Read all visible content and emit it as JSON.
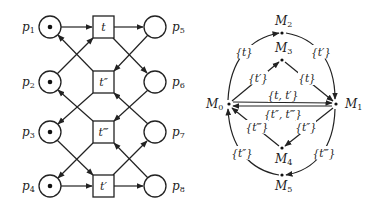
{
  "petri_net": {
    "places": [
      {
        "id": "p1",
        "label": "p",
        "sub": "1",
        "x": 50,
        "y": 27,
        "token": true,
        "label_side": "left"
      },
      {
        "id": "p2",
        "label": "p",
        "sub": "2",
        "x": 50,
        "y": 82,
        "token": true,
        "label_side": "left"
      },
      {
        "id": "p3",
        "label": "p",
        "sub": "3",
        "x": 50,
        "y": 132,
        "token": true,
        "label_side": "left"
      },
      {
        "id": "p4",
        "label": "p",
        "sub": "4",
        "x": 50,
        "y": 186,
        "token": true,
        "label_side": "left"
      },
      {
        "id": "p5",
        "label": "p",
        "sub": "5",
        "x": 155,
        "y": 27,
        "token": false,
        "label_side": "right"
      },
      {
        "id": "p6",
        "label": "p",
        "sub": "6",
        "x": 155,
        "y": 82,
        "token": false,
        "label_side": "right"
      },
      {
        "id": "p7",
        "label": "p",
        "sub": "7",
        "x": 155,
        "y": 132,
        "token": false,
        "label_side": "right"
      },
      {
        "id": "p8",
        "label": "p",
        "sub": "8",
        "x": 155,
        "y": 186,
        "token": false,
        "label_side": "right"
      }
    ],
    "transitions": [
      {
        "id": "t",
        "label": "t",
        "x": 103,
        "y": 27
      },
      {
        "id": "t2",
        "label": "t″",
        "x": 103,
        "y": 82
      },
      {
        "id": "t3",
        "label": "t‴",
        "x": 103,
        "y": 132
      },
      {
        "id": "t1",
        "label": "t′",
        "x": 103,
        "y": 186
      }
    ]
  },
  "reachability_graph": {
    "nodes": [
      {
        "id": "M0",
        "label": "M",
        "sub": "0"
      },
      {
        "id": "M1",
        "label": "M",
        "sub": "1"
      },
      {
        "id": "M2",
        "label": "M",
        "sub": "2"
      },
      {
        "id": "M3",
        "label": "M",
        "sub": "3"
      },
      {
        "id": "M4",
        "label": "M",
        "sub": "4"
      },
      {
        "id": "M5",
        "label": "M",
        "sub": "5"
      }
    ],
    "edges": [
      {
        "from": "M0",
        "to": "M2",
        "label": "{t}"
      },
      {
        "from": "M2",
        "to": "M1",
        "label": "{t′}"
      },
      {
        "from": "M0",
        "to": "M3",
        "label": "{t′}"
      },
      {
        "from": "M3",
        "to": "M1",
        "label": "{t}"
      },
      {
        "from": "M0",
        "to": "M1",
        "label": "{t, t′}"
      },
      {
        "from": "M1",
        "to": "M0",
        "label": "{t″, t‴}"
      },
      {
        "from": "M1",
        "to": "M4",
        "label": "{t″}"
      },
      {
        "from": "M4",
        "to": "M0",
        "label": "{t‴}"
      },
      {
        "from": "M1",
        "to": "M5",
        "label": "{t‴}"
      },
      {
        "from": "M5",
        "to": "M0",
        "label": "{t″}"
      }
    ]
  }
}
